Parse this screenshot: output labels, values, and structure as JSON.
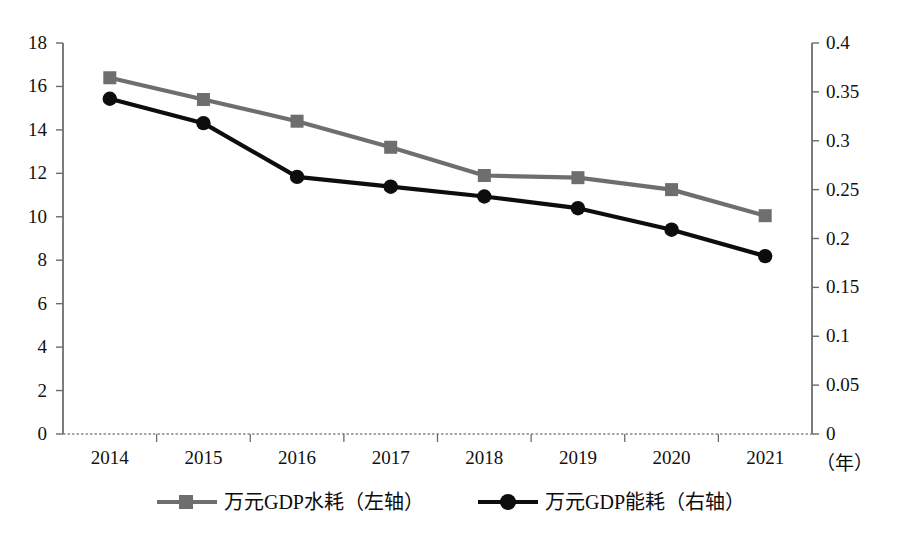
{
  "chart_data": {
    "type": "line",
    "title": "",
    "xlabel": "（年）",
    "ylabel": "",
    "categories": [
      "2014",
      "2015",
      "2016",
      "2017",
      "2018",
      "2019",
      "2020",
      "2021"
    ],
    "grid": false,
    "legend_position": "bottom",
    "axes": {
      "x": {
        "tick_labels": [
          "2014",
          "2015",
          "2016",
          "2017",
          "2018",
          "2019",
          "2020",
          "2021"
        ],
        "unit_label": "（年）"
      },
      "y_left": {
        "ylim": [
          0,
          18
        ],
        "tick_step": 2,
        "tick_labels": [
          "0",
          "2",
          "4",
          "6",
          "8",
          "10",
          "12",
          "14",
          "16",
          "18"
        ]
      },
      "y_right": {
        "ylim": [
          0,
          0.4
        ],
        "tick_step": 0.05,
        "tick_labels": [
          "0",
          "0.05",
          "0.1",
          "0.15",
          "0.2",
          "0.25",
          "0.3",
          "0.35",
          "0.4"
        ]
      }
    },
    "series": [
      {
        "name": "万元GDP水耗（左轴）",
        "axis": "left",
        "color": "#6e6e6e",
        "marker": "square",
        "values": [
          16.4,
          15.4,
          14.4,
          13.2,
          11.9,
          11.8,
          11.25,
          10.05
        ]
      },
      {
        "name": "万元GDP能耗（右轴）",
        "axis": "right",
        "color": "#0d0d0d",
        "marker": "circle",
        "values": [
          0.343,
          0.318,
          0.263,
          0.253,
          0.243,
          0.231,
          0.209,
          0.182
        ]
      }
    ]
  },
  "legend": {
    "entries": [
      {
        "label": "万元GDP水耗（左轴）",
        "marker": "square",
        "color": "#6e6e6e"
      },
      {
        "label": "万元GDP能耗（右轴）",
        "marker": "circle",
        "color": "#0d0d0d"
      }
    ]
  }
}
